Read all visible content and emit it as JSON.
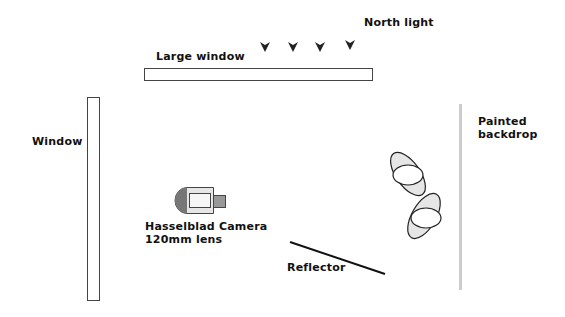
{
  "diagram": {
    "labels": {
      "north_light": "North light",
      "large_window": "Large window",
      "window": "Window",
      "painted_backdrop_line1": "Painted",
      "painted_backdrop_line2": "backdrop",
      "camera_line1": "Hasselblad Camera",
      "camera_line2": "120mm lens",
      "reflector": "Reflector"
    },
    "elements": [
      {
        "id": "large-window",
        "type": "rect",
        "x": 144,
        "y": 68,
        "w": 228,
        "h": 12
      },
      {
        "id": "window",
        "type": "rect",
        "x": 87,
        "y": 97,
        "w": 12,
        "h": 203
      },
      {
        "id": "painted-backdrop",
        "type": "bar",
        "x": 459,
        "y": 104,
        "w": 3,
        "h": 186
      },
      {
        "id": "reflector",
        "type": "line",
        "x1": 290,
        "y1": 242,
        "x2": 385,
        "y2": 274
      },
      {
        "id": "camera",
        "type": "camera",
        "x": 175,
        "y": 187
      },
      {
        "id": "light-1",
        "type": "light",
        "cx": 408,
        "cy": 174
      },
      {
        "id": "light-2",
        "type": "light",
        "cx": 424,
        "cy": 217
      }
    ],
    "north_light_arrows": [
      265,
      293,
      320,
      350
    ],
    "colors": {
      "stroke": "#333333",
      "fill_grey": "#e6e6e6",
      "camera_grey": "#777777",
      "backdrop": "#cccccc",
      "text": "#111111"
    }
  }
}
